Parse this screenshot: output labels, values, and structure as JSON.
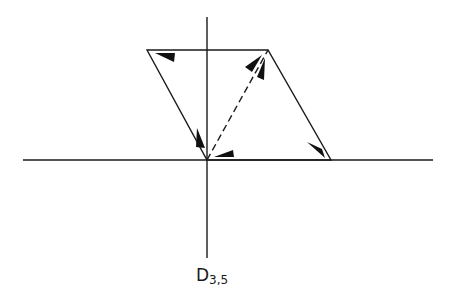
{
  "diagram": {
    "label_main": "D",
    "label_sub": "3,5",
    "colors": {
      "background": "#ffffff",
      "stroke": "#1a1a1a",
      "fill": "#111111"
    },
    "axes": {
      "vertical": {
        "x": 207,
        "y1": 17,
        "y2": 258
      },
      "horizontal": {
        "y": 160,
        "x1": 23,
        "x2": 433
      }
    },
    "parallelogram": {
      "vertices": [
        [
          147,
          50
        ],
        [
          268,
          50
        ],
        [
          331,
          160
        ],
        [
          207,
          160
        ]
      ]
    },
    "dashed_diagonal": {
      "from": [
        207,
        160
      ],
      "to": [
        268,
        50
      ]
    },
    "arrowheads": [
      {
        "name": "top-left-arrowhead",
        "points": "155,53 175,53 174,62"
      },
      {
        "name": "left-edge-arrowhead",
        "points": "198,128 197,146 205,148"
      },
      {
        "name": "origin-right-arrowhead",
        "points": "213,156 232,150 233,157"
      },
      {
        "name": "diagonal-up-arrowhead-1",
        "points": "259,58 246,68 252,71"
      },
      {
        "name": "diagonal-up-arrowhead-2",
        "points": "264,60 256,76 262,79"
      },
      {
        "name": "right-edge-arrowhead",
        "points": "309,143 320,151 324,158"
      }
    ]
  }
}
